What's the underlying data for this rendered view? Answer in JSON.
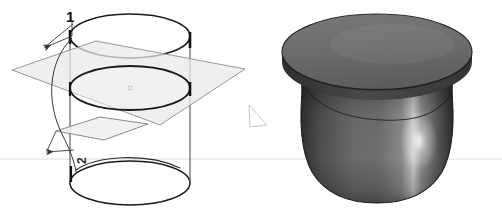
{
  "figure": {
    "background_color": "#ffffff",
    "width": 502,
    "height": 215,
    "horizon_line": {
      "name": "horizon-rule",
      "y": 159,
      "color": "#dcdcdc",
      "x_start": 0,
      "x_end": 502
    },
    "panels": [
      {
        "id": "left-panel",
        "name": "wireframe-construction-diagram",
        "description": "Wireframe cylinder intersected by a translucent inclined plane with two numbered callouts"
      },
      {
        "id": "right-panel",
        "name": "shaded-solid-render",
        "description": "Shaded grey solid with a flat disc brim and a rounded bulbous body"
      }
    ]
  },
  "left_panel": {
    "callouts": [
      {
        "id": "callout-1",
        "label": "1",
        "x": 66,
        "y": 9,
        "target": "upper-intersection-edge"
      },
      {
        "id": "callout-2",
        "label": "2",
        "x": 76,
        "y": 164,
        "rotation": -90,
        "target": "lower-intersection-edge"
      }
    ],
    "geometry": {
      "cylinder": {
        "name": "wireframe-cylinder",
        "stroke": "#1a1a1a",
        "stroke_width": 1.6,
        "center_x": 130,
        "radius_x": 60,
        "radius_y": 22,
        "top_ellipse_cy": 36,
        "mid_ellipse_cy": 88,
        "bottom_ellipse_cy": 183,
        "left_wall_x": 70,
        "right_wall_x": 190,
        "wall_stroke": "#555555"
      },
      "plane": {
        "name": "inclined-cutting-plane",
        "fill": "#e8e8e8",
        "fill_opacity": 0.72,
        "stroke": "#8a8a8a",
        "stroke_width": 0.9,
        "points": "12,70 96,41 245,69 160,125"
      },
      "tab": {
        "name": "plane-edge-tab",
        "fill": "#efefef",
        "stroke": "#7d7d7d",
        "points": "56,131 100,117 148,124 104,140"
      },
      "leaders": {
        "name": "callout-leader-lines",
        "stroke": "#3a3a3a",
        "stroke_width": 0.9
      },
      "center_mark": {
        "name": "ellipse-center-mark",
        "x": 130,
        "y": 88,
        "color": "#b9b9b9"
      }
    }
  },
  "right_panel": {
    "solid": {
      "name": "revolved-solid",
      "brim": {
        "name": "solid-brim-disc",
        "center_x": 377,
        "center_y": 52,
        "radius_x": 95,
        "radius_y": 38,
        "fill_top": "#6e6e6e",
        "fill_bottom": "#5a5a5a",
        "edge_color": "#2b2b2b"
      },
      "body": {
        "name": "solid-bulb-body",
        "top_y": 82,
        "bottom_y": 200,
        "left_x": 300,
        "right_x": 452,
        "fill_dark": "#3b3b3b",
        "fill_mid": "#6a6a6a",
        "highlight": "#e4e4e4",
        "seam_color": "#2a2a2a"
      }
    },
    "artifact": {
      "name": "stray-triangle-artifact",
      "points": "249,105 266,124 250,126",
      "stroke": "#c4c4c4"
    }
  }
}
